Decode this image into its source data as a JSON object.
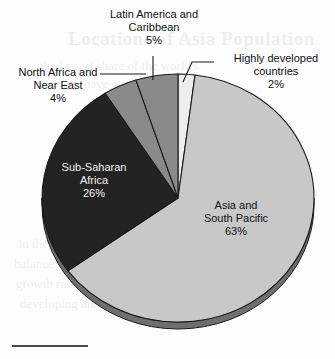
{
  "page": {
    "background_color": "#fdfdfd",
    "rule_color": "#4a4a4a",
    "bleed_texts": [
      "Locations of Asia Population",
      "the largest share of the world's",
      "numbers have continued to rise",
      "In the coming decades the",
      "balance will shift as regional",
      "growth rates diverge across the",
      "developing and developed world"
    ]
  },
  "chart_data": {
    "type": "pie",
    "title": "",
    "subtitle": "",
    "xlabel": "",
    "ylabel": "",
    "legend_position": "none",
    "grid": false,
    "units": "percent",
    "start_angle_deg": 0,
    "direction": "clockwise",
    "categories": [
      "Highly developed countries",
      "Asia and South Pacific",
      "Sub-Saharan Africa",
      "North Africa and Near East",
      "Latin America and Caribbean"
    ],
    "values": [
      2,
      63,
      26,
      4,
      5
    ],
    "slices": [
      {
        "name": "highly-developed-countries",
        "label": "Highly developed",
        "label_line2": "countries",
        "value": 2,
        "percent": "2%",
        "color": "#ededed",
        "label_placement": "outside",
        "label_text_color": "#101010"
      },
      {
        "name": "asia-and-south-pacific",
        "label": "Asia and",
        "label_line2": "South Pacific",
        "value": 63,
        "percent": "63%",
        "color": "#c8c8c8",
        "label_placement": "inside",
        "label_text_color": "#101010"
      },
      {
        "name": "sub-saharan-africa",
        "label": "Sub-Saharan",
        "label_line2": "Africa",
        "value": 26,
        "percent": "26%",
        "color": "#232323",
        "label_placement": "inside",
        "label_text_color": "#f2f2f2"
      },
      {
        "name": "north-africa-and-near-east",
        "label": "North Africa and",
        "label_line2": "Near East",
        "value": 4,
        "percent": "4%",
        "color": "#8a8a8a",
        "label_placement": "outside",
        "label_text_color": "#101010"
      },
      {
        "name": "latin-america-and-caribbean",
        "label": "Latin America and",
        "label_line2": "Caribbean",
        "value": 5,
        "percent": "5%",
        "color": "#8a8a8a",
        "label_placement": "outside",
        "label_text_color": "#101010"
      }
    ],
    "geometry": {
      "center_x": 178,
      "center_y": 198,
      "radius_x": 136,
      "radius_y": 124,
      "depth": 7,
      "rim_color": "#6f6f6f",
      "outline_color": "#1a1a1a"
    }
  }
}
